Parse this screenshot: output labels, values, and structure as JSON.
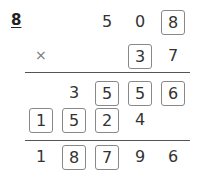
{
  "problem_number": "8",
  "operator": "×",
  "rows": [
    {
      "name": "multiplicand",
      "cells": [
        {
          "col": 2,
          "text": "5",
          "boxed": false
        },
        {
          "col": 3,
          "text": "0",
          "boxed": false
        },
        {
          "col": 4,
          "text": "8",
          "boxed": true
        }
      ]
    },
    {
      "name": "multiplier",
      "cells": [
        {
          "col": 3,
          "text": "3",
          "boxed": true
        },
        {
          "col": 4,
          "text": "7",
          "boxed": false
        }
      ]
    },
    {
      "name": "partial-product-1",
      "cells": [
        {
          "col": 1,
          "text": "3",
          "boxed": false
        },
        {
          "col": 2,
          "text": "5",
          "boxed": true
        },
        {
          "col": 3,
          "text": "5",
          "boxed": true
        },
        {
          "col": 4,
          "text": "6",
          "boxed": true
        }
      ]
    },
    {
      "name": "partial-product-2",
      "cells": [
        {
          "col": 0,
          "text": "1",
          "boxed": true
        },
        {
          "col": 1,
          "text": "5",
          "boxed": true
        },
        {
          "col": 2,
          "text": "2",
          "boxed": true
        },
        {
          "col": 3,
          "text": "4",
          "boxed": false
        }
      ]
    },
    {
      "name": "final-product",
      "cells": [
        {
          "col": 0,
          "text": "1",
          "boxed": false
        },
        {
          "col": 1,
          "text": "8",
          "boxed": true
        },
        {
          "col": 2,
          "text": "7",
          "boxed": true
        },
        {
          "col": 3,
          "text": "9",
          "boxed": false
        },
        {
          "col": 4,
          "text": "6",
          "boxed": false
        }
      ]
    }
  ]
}
